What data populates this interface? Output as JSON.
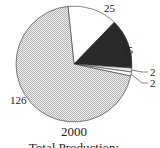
{
  "chart_data": {
    "type": "pie",
    "title": "2000",
    "subtitle": "Total Production:",
    "slices": [
      {
        "label": "25",
        "value": 25,
        "fill": "white"
      },
      {
        "label": "25",
        "value": 25,
        "fill": "dark"
      },
      {
        "label": "2",
        "value": 2,
        "fill": "light"
      },
      {
        "label": "2",
        "value": 2,
        "fill": "white"
      },
      {
        "label": "126",
        "value": 126,
        "fill": "checker"
      }
    ],
    "colors": {
      "dark": "#2a2a2a",
      "white": "#ffffff",
      "light": "#e6e6e6",
      "checker_a": "#bdbdbd",
      "checker_b": "#eeeeee",
      "stroke": "#333333"
    }
  }
}
